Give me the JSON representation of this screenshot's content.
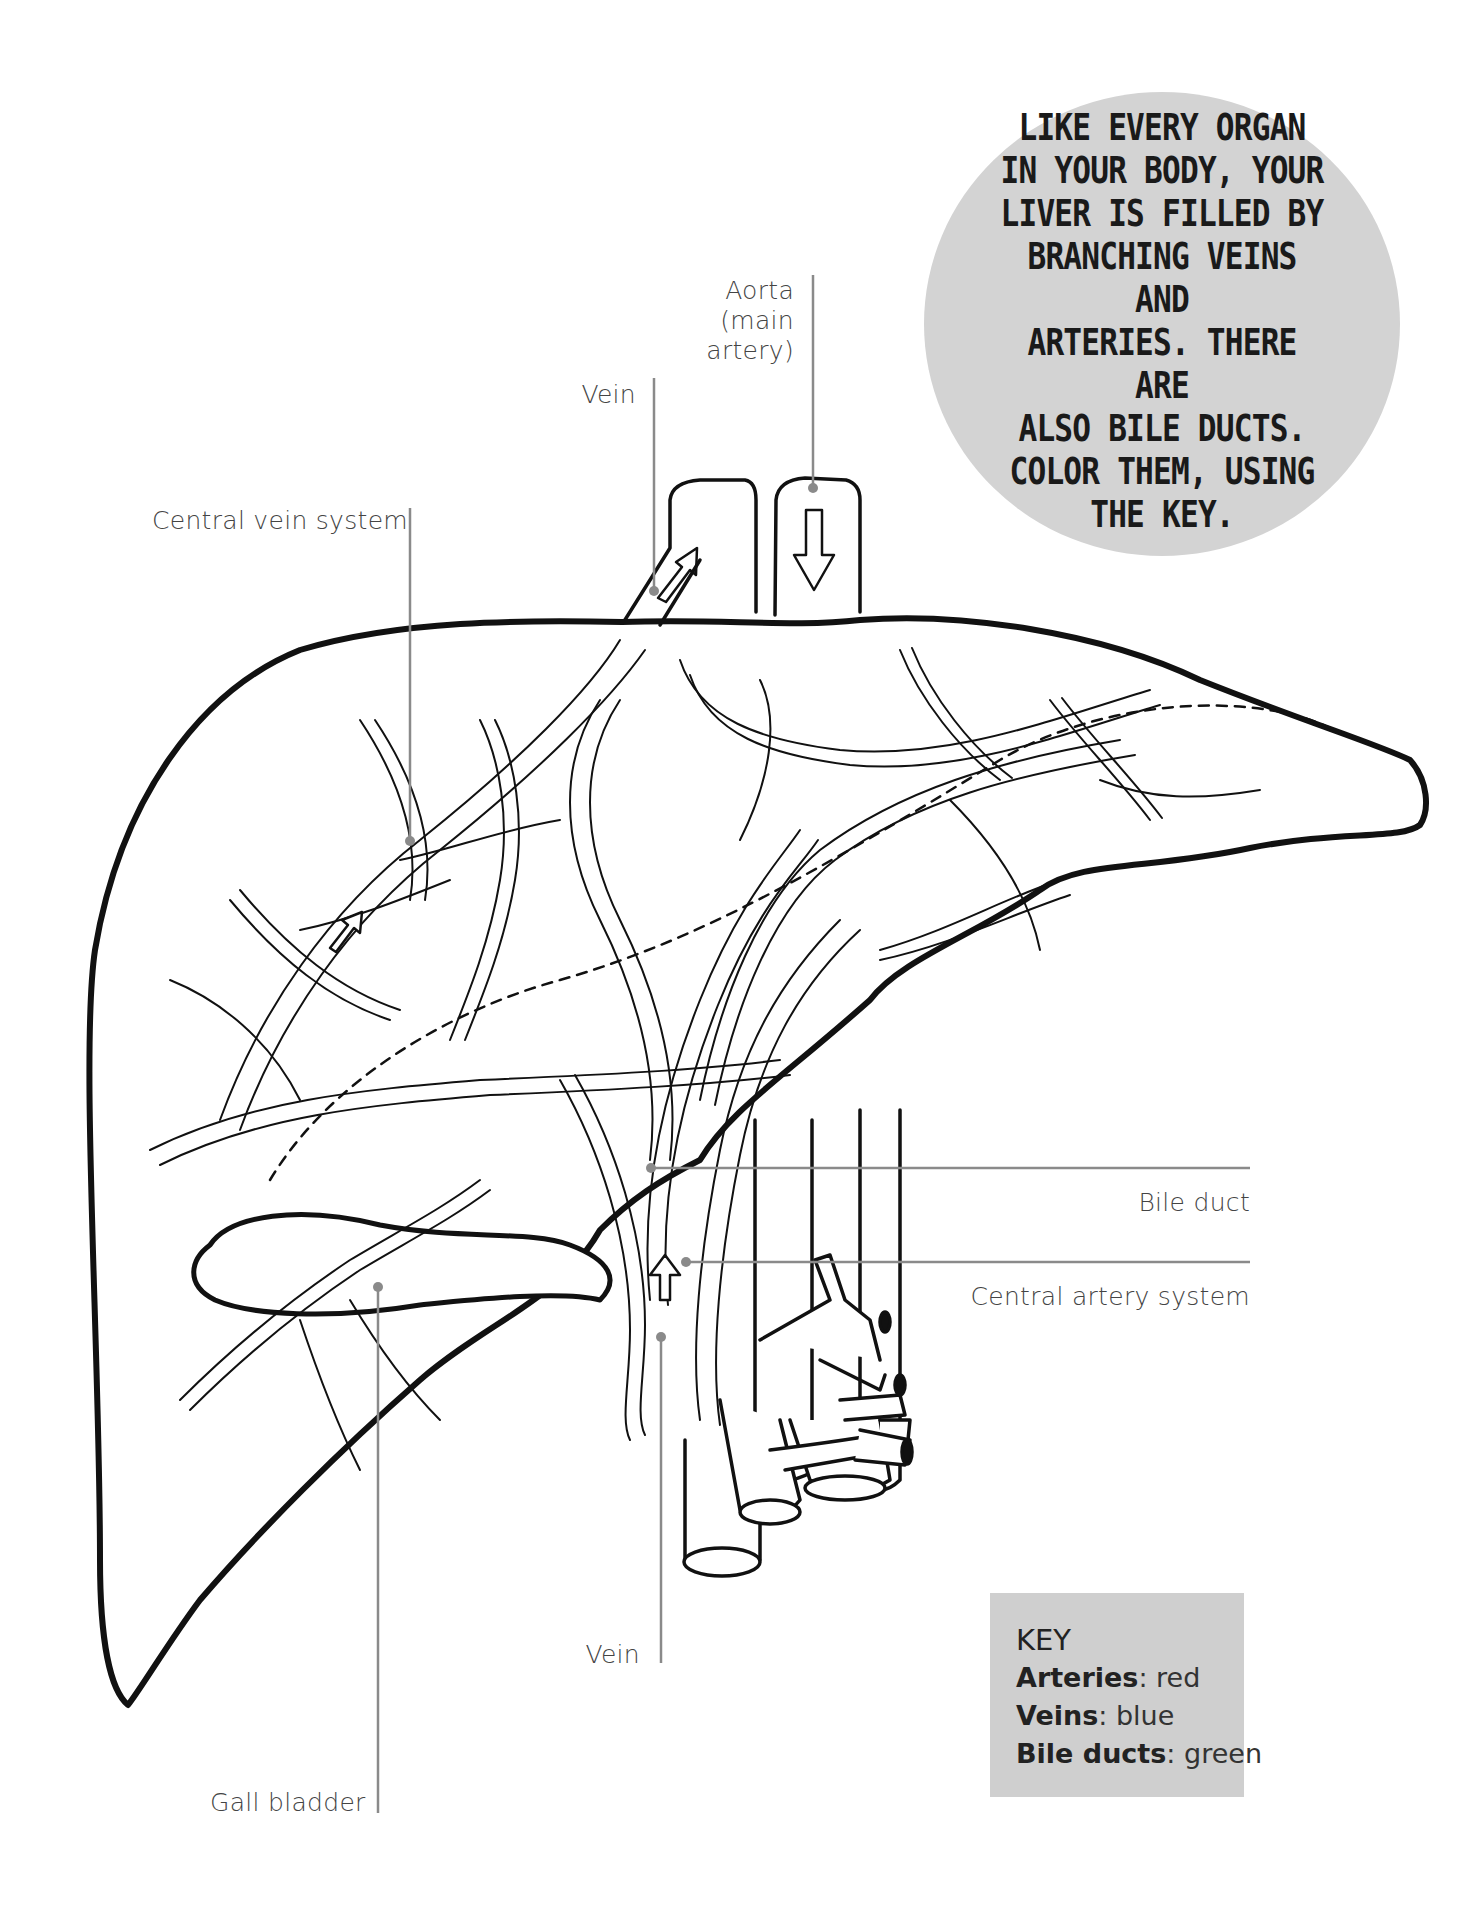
{
  "diagram": {
    "type": "anatomical coloring page",
    "line_color": "#111111",
    "leader_color": "#8a8a8a",
    "callout_bg": "#d3d3d3",
    "key_bg": "#cfcfcf"
  },
  "callout": {
    "lines": [
      "LIKE EVERY ORGAN",
      "IN YOUR BODY, YOUR",
      "LIVER IS FILLED BY",
      "BRANCHING VEINS AND",
      "ARTERIES. THERE ARE",
      "ALSO BILE DUCTS.",
      "COLOR THEM, USING",
      "THE KEY."
    ]
  },
  "labels": {
    "aorta": [
      "Aorta",
      "(main",
      "artery)"
    ],
    "vein_top": "Vein",
    "central_vein_system": "Central vein system",
    "bile_duct": "Bile duct",
    "central_artery_system": "Central artery system",
    "vein_bottom": "Vein",
    "gall_bladder": "Gall bladder"
  },
  "key": {
    "title": "KEY",
    "items": [
      {
        "term": "Arteries",
        "sep": ": ",
        "color_name": "red",
        "color": "#d62b2b"
      },
      {
        "term": "Veins",
        "sep": ": ",
        "color_name": "blue",
        "color": "#2b5fd6"
      },
      {
        "term": "Bile ducts",
        "sep": ": ",
        "color_name": "green",
        "color": "#2ba34a"
      }
    ]
  }
}
